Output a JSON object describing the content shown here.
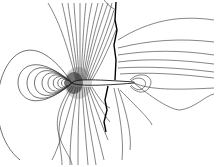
{
  "figure": {
    "type": "contour-plot",
    "line_color": "#222222",
    "background": "#ffffff",
    "airfoil": {
      "leading_edge_x": 72,
      "trailing_edge_x": 134,
      "chord_y": 83,
      "fill": "#ffffff"
    },
    "shock": {
      "upper_x": 116,
      "lower_x": 104,
      "color": "#000000"
    }
  }
}
